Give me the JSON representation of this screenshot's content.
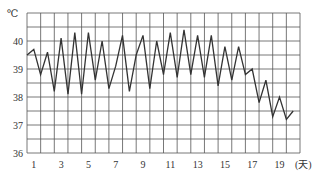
{
  "chart_data": {
    "type": "line",
    "title": "",
    "ylabel": "℃",
    "xlabel": "(天)",
    "ylim": [
      36,
      41
    ],
    "xlim": [
      0.5,
      20.5
    ],
    "grid": true,
    "y_ticks": [
      "36",
      "37",
      "38",
      "39",
      "40"
    ],
    "x_ticks": [
      "1",
      "3",
      "5",
      "7",
      "9",
      "11",
      "13",
      "15",
      "17",
      "19"
    ],
    "x_tick_values": [
      1,
      3,
      5,
      7,
      9,
      11,
      13,
      15,
      17,
      19
    ],
    "y_tick_values": [
      36,
      37,
      38,
      39,
      40
    ],
    "series": [
      {
        "name": "体温",
        "color": "#333333",
        "x": [
          0.5,
          1,
          1.5,
          2,
          2.5,
          3,
          3.5,
          4,
          4.5,
          5,
          5.5,
          6,
          6.5,
          7,
          7.5,
          8,
          8.5,
          9,
          9.5,
          10,
          10.5,
          11,
          11.5,
          12,
          12.5,
          13,
          13.5,
          14,
          14.5,
          15,
          15.5,
          16,
          16.5,
          17,
          17.5,
          18,
          18.5,
          19,
          19.5,
          20
        ],
        "values": [
          39.5,
          39.7,
          38.8,
          39.6,
          38.2,
          40.1,
          38.1,
          40.3,
          38.1,
          40.3,
          38.6,
          40.0,
          38.3,
          39.1,
          40.2,
          38.2,
          39.5,
          40.2,
          38.3,
          40.0,
          38.8,
          40.3,
          38.7,
          40.4,
          38.8,
          40.2,
          38.7,
          40.2,
          38.4,
          39.8,
          38.6,
          39.8,
          38.8,
          39.0,
          37.8,
          38.6,
          37.3,
          38.0,
          37.2,
          37.5
        ]
      }
    ]
  },
  "style": {
    "grid_color": "#555555",
    "line_color": "#333333",
    "text_color": "#333333",
    "background": "#ffffff"
  }
}
